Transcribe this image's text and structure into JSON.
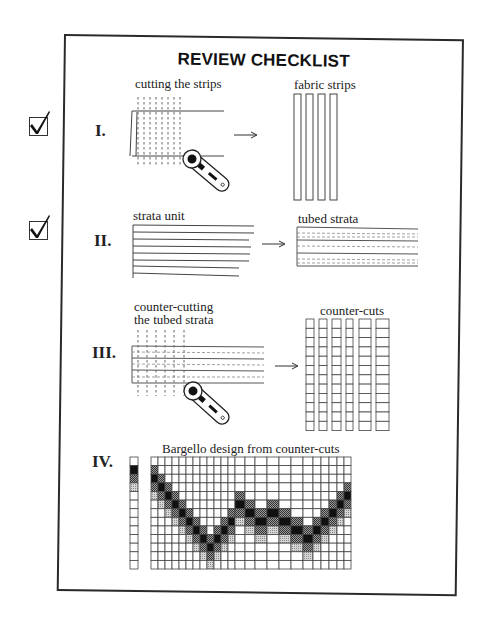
{
  "title": "REVIEW CHECKLIST",
  "checkboxes": [
    {
      "step": "I",
      "checked": true
    },
    {
      "step": "II",
      "checked": true
    }
  ],
  "steps": [
    {
      "numeral": "I.",
      "left_label": "cutting the strips",
      "right_label": "fabric strips"
    },
    {
      "numeral": "II.",
      "left_label": "strata unit",
      "right_label": "tubed strata"
    },
    {
      "numeral": "III.",
      "left_label_line1": "counter-cutting",
      "left_label_line2": "the tubed strata",
      "right_label": "counter-cuts"
    },
    {
      "numeral": "IV.",
      "label": "Bargello design from counter-cuts"
    }
  ],
  "icons": {
    "arrow": "right-arrow-icon",
    "cutter": "rotary-cutter-icon",
    "check": "checkmark-icon"
  },
  "bargello": {
    "key_strip": [
      "white",
      "black",
      "dark",
      "light",
      "white",
      "white",
      "white",
      "white",
      "white",
      "white",
      "white",
      "white",
      "white"
    ],
    "rows": 13,
    "column_widths": [
      7,
      7,
      7,
      7,
      7,
      7,
      7,
      7,
      7,
      7,
      7,
      7,
      10,
      10,
      12,
      12,
      12,
      12,
      10,
      8,
      8,
      8,
      7,
      7
    ],
    "black_row": [
      2,
      3,
      4,
      5,
      6,
      7,
      8,
      9,
      10,
      9,
      8,
      7,
      5,
      6,
      7,
      6,
      7,
      8,
      9,
      8,
      7,
      6,
      5,
      4
    ]
  },
  "colors": {
    "line": "#333333",
    "black": "#111111",
    "dark_hatch": "#6a6a6a",
    "light_hatch": "#b4b4b4",
    "white": "#ffffff"
  }
}
